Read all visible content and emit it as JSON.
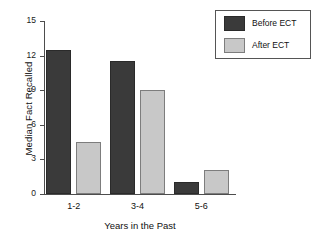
{
  "chart_data": {
    "type": "bar",
    "title": "",
    "xlabel": "Years in the Past",
    "ylabel": "Median Fact Recalled",
    "categories": [
      "1-2",
      "3-4",
      "5-6"
    ],
    "series": [
      {
        "name": "Before ECT",
        "color": "#3a3a3a",
        "values": [
          12.5,
          11.5,
          1.0
        ]
      },
      {
        "name": "After ECT",
        "color": "#c8c8c8",
        "values": [
          4.5,
          9.0,
          2.1
        ]
      }
    ],
    "ylim": [
      0,
      15
    ],
    "yticks": [
      0,
      3,
      6,
      9,
      12,
      15
    ],
    "ytick_labels": [
      "0",
      "3",
      "6",
      "9",
      "12",
      "15"
    ],
    "grid": false,
    "legend_position": "top-right",
    "legend_entries": [
      "Before ECT",
      "After ECT"
    ],
    "background_color": "#ffffff",
    "axis_color": "#4d4d4d"
  }
}
